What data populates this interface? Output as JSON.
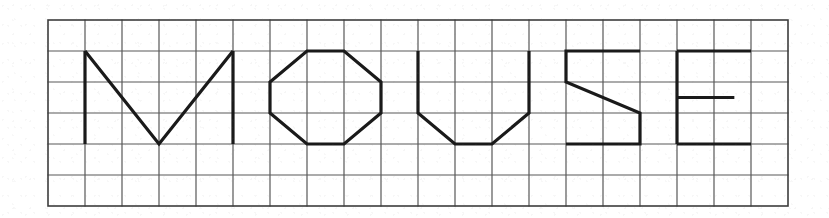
{
  "image": {
    "title": "MOUSE",
    "description": "Hand-drawn block letters spelling MOUSE on a ruled grid",
    "word": "MOUSE",
    "background_color": "#ffffff",
    "ink_color": "#1a1a1a",
    "grid_line_color": "#585858"
  },
  "grid": {
    "origin_x": 48,
    "origin_y": 20,
    "cell_width": 37,
    "cell_height": 31,
    "columns": 20,
    "rows": 6,
    "border_color": "#3d3d3d",
    "border_width": 1.6,
    "line_width": 1.2
  },
  "letters": [
    {
      "char": "M",
      "stroke_width": 3.2,
      "strokes": [
        {
          "kind": "polyline",
          "points": "1,1 1,4"
        },
        {
          "kind": "polyline",
          "points": "1,1 3,4 5,1"
        },
        {
          "kind": "polyline",
          "points": "5,1 5,4"
        }
      ]
    },
    {
      "char": "O",
      "stroke_width": 3.2,
      "strokes": [
        {
          "kind": "polygon",
          "points": "7,1 8,1 9,2 9,3 8,4 7,4 6,3 6,2"
        }
      ]
    },
    {
      "char": "U",
      "stroke_width": 3.2,
      "strokes": [
        {
          "kind": "polyline",
          "points": "10,1 10,3 11,4 12,4 13,3 13,1"
        }
      ]
    },
    {
      "char": "S",
      "stroke_width": 3.2,
      "strokes": [
        {
          "kind": "polyline",
          "points": "16,1 14,1 14,2 16,3 16,4 14,4"
        }
      ]
    },
    {
      "char": "E",
      "stroke_width": 3.2,
      "strokes": [
        {
          "kind": "polyline",
          "points": "17,1 17,4"
        },
        {
          "kind": "polyline",
          "points": "17,1 19,1"
        },
        {
          "kind": "polyline",
          "points": "17,4 19,4"
        },
        {
          "kind": "polyline",
          "points": "17,2.5 18.55,2.5"
        }
      ]
    }
  ]
}
